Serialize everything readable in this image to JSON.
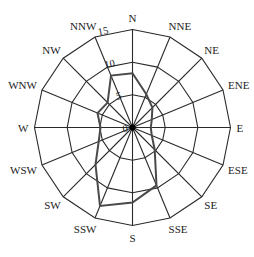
{
  "chart_data": {
    "type": "radar",
    "title": "",
    "categories": [
      "N",
      "NNE",
      "NE",
      "ENE",
      "E",
      "ESE",
      "SE",
      "SSE",
      "S",
      "SSW",
      "SW",
      "WSW",
      "W",
      "WNW",
      "NW",
      "NNW"
    ],
    "series": [
      {
        "name": "frequency",
        "values": [
          8.3,
          5.5,
          4.3,
          3.2,
          2.8,
          3.2,
          4.8,
          9.6,
          11.5,
          13.0,
          8.0,
          5.6,
          4.9,
          5.8,
          5.4,
          8.6
        ]
      }
    ],
    "radial_ticks": [
      0,
      5,
      10,
      15
    ],
    "rlim": [
      0,
      15
    ],
    "grid": true,
    "legend": "none",
    "colors": {
      "grid": "#2a2a2a",
      "series": "#4a4a4a",
      "text": "#222222"
    }
  }
}
